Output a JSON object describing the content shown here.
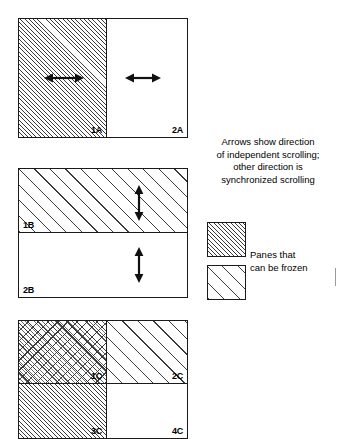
{
  "figure": {
    "kind": "pane-splitting-diagram",
    "background": "#ffffff",
    "line_color": "#1a1a1a",
    "hatch_color": "#3a3a3a"
  },
  "diagrams": [
    {
      "id": "A",
      "name": "vertical-split-two-panes",
      "split": "vertical",
      "panes": [
        {
          "label": "1A",
          "fill": "dense",
          "arrow": "horizontal-double"
        },
        {
          "label": "2A",
          "fill": "plain",
          "arrow": "horizontal-double"
        }
      ]
    },
    {
      "id": "B",
      "name": "horizontal-split-two-panes",
      "split": "horizontal",
      "panes": [
        {
          "label": "1B",
          "fill": "wide",
          "arrow": "vertical-double"
        },
        {
          "label": "2B",
          "fill": "plain",
          "arrow": "vertical-double"
        }
      ]
    },
    {
      "id": "C",
      "name": "four-way-split-panes",
      "split": "quad",
      "panes": [
        {
          "label": "1C",
          "fill": "cross",
          "arrow": "none"
        },
        {
          "label": "2C",
          "fill": "wide",
          "arrow": "none"
        },
        {
          "label": "3C",
          "fill": "dense",
          "arrow": "none"
        },
        {
          "label": "4C",
          "fill": "plain",
          "arrow": "none"
        }
      ]
    }
  ],
  "caption": {
    "name": "arrows-caption",
    "lines": [
      "Arrows show direction",
      "of independent scrolling;",
      "other direction is",
      "synchronized scrolling"
    ],
    "line0": "Arrows show direction",
    "line1": "of independent scrolling;",
    "line2": "other direction is",
    "line3": "synchronized scrolling"
  },
  "legend": {
    "name": "frozen-panes-legend",
    "swatches": [
      {
        "fill": "dense",
        "name": "legend-swatch-dense"
      },
      {
        "fill": "wide",
        "name": "legend-swatch-wide"
      }
    ],
    "lines": [
      "Panes that",
      "can be frozen"
    ],
    "line0": "Panes that",
    "line1": "can be frozen"
  }
}
